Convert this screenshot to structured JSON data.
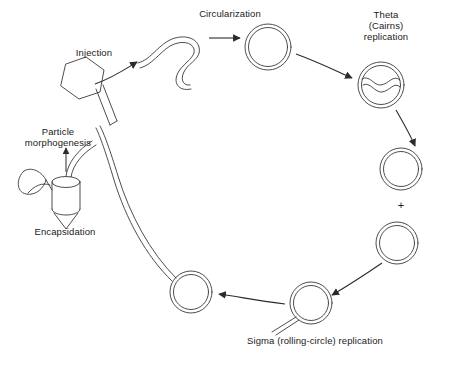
{
  "figure": {
    "type": "diagram",
    "background_color": "#ffffff",
    "stroke_color": "#3a3a3a",
    "text_color": "#1a1a1a"
  },
  "labels": {
    "injection": "Injection",
    "circularization": "Circularization",
    "theta": "Theta\n(Cairns)\nreplication",
    "plus": "+",
    "sigma": "Sigma (rolling-circle) replication",
    "particle_morphogenesis": "Particle\nmorphogenesis",
    "encapsidation": "Encapsidation"
  },
  "stages": [
    {
      "id": "phage-particle",
      "name": "phage virion"
    },
    {
      "id": "linear-dna",
      "name": "injected linear DNA"
    },
    {
      "id": "circular-dna",
      "name": "circularized DNA"
    },
    {
      "id": "theta-intermediate",
      "name": "theta replication intermediate"
    },
    {
      "id": "daughter-circle-upper",
      "name": "daughter circle"
    },
    {
      "id": "daughter-circle-lower",
      "name": "daughter circle"
    },
    {
      "id": "rolling-circle-right",
      "name": "rolling circle"
    },
    {
      "id": "rolling-circle-left",
      "name": "rolling circle with concatemer tail"
    },
    {
      "id": "prohead",
      "name": "prohead / encapsidation"
    }
  ],
  "arrows": [
    {
      "from": "phage-particle",
      "to": "linear-dna",
      "label": "Injection"
    },
    {
      "from": "linear-dna",
      "to": "circular-dna",
      "label": "Circularization"
    },
    {
      "from": "circular-dna",
      "to": "theta-intermediate",
      "label": "Theta (Cairns) replication"
    },
    {
      "from": "theta-intermediate",
      "to": "daughter-circle-upper",
      "label": ""
    },
    {
      "from": "daughter-circle-lower",
      "to": "rolling-circle-right",
      "label": ""
    },
    {
      "from": "rolling-circle-right",
      "to": "rolling-circle-left",
      "label": "Sigma (rolling-circle) replication"
    },
    {
      "from": "prohead",
      "to": "phage-particle",
      "label": "Particle morphogenesis"
    }
  ]
}
